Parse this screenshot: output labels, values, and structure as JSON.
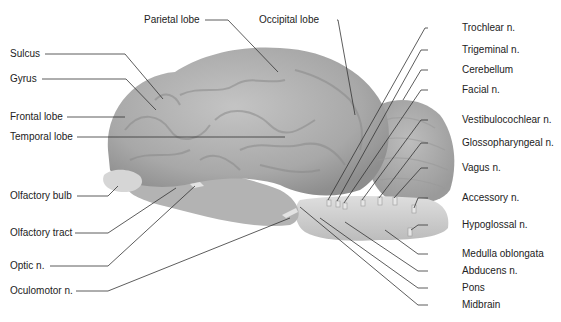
{
  "diagram": {
    "colors": {
      "brain": "#a9a9a9",
      "brain_light": "#c8c8c8",
      "brainstem": "#d2d2d2",
      "leader_line": "#333333",
      "text": "#222222"
    },
    "labels_left": [
      {
        "id": "sulcus",
        "text": "Sulcus"
      },
      {
        "id": "gyrus",
        "text": "Gyrus"
      },
      {
        "id": "frontal",
        "text": "Frontal lobe"
      },
      {
        "id": "temporal",
        "text": "Temporal lobe"
      },
      {
        "id": "olf_bulb",
        "text": "Olfactory bulb"
      },
      {
        "id": "olf_tract",
        "text": "Olfactory tract"
      },
      {
        "id": "optic",
        "text": "Optic n."
      },
      {
        "id": "oculomotor",
        "text": "Oculomotor n."
      }
    ],
    "labels_top": [
      {
        "id": "parietal",
        "text": "Parietal lobe"
      },
      {
        "id": "occipital",
        "text": "Occipital lobe"
      }
    ],
    "labels_right": [
      {
        "id": "trochlear",
        "text": "Trochlear n."
      },
      {
        "id": "trigeminal",
        "text": "Trigeminal n."
      },
      {
        "id": "cerebellum",
        "text": "Cerebellum"
      },
      {
        "id": "facial",
        "text": "Facial n."
      },
      {
        "id": "vestibulo",
        "text": "Vestibulocochlear n."
      },
      {
        "id": "glosso",
        "text": "Glossopharyngeal n."
      },
      {
        "id": "vagus",
        "text": "Vagus n."
      },
      {
        "id": "accessory",
        "text": "Accessory n."
      },
      {
        "id": "hypoglossal",
        "text": "Hypoglossal n."
      },
      {
        "id": "medulla",
        "text": "Medulla oblongata"
      },
      {
        "id": "abducens",
        "text": "Abducens n."
      },
      {
        "id": "pons",
        "text": "Pons"
      },
      {
        "id": "midbrain",
        "text": "Midbrain"
      }
    ]
  }
}
